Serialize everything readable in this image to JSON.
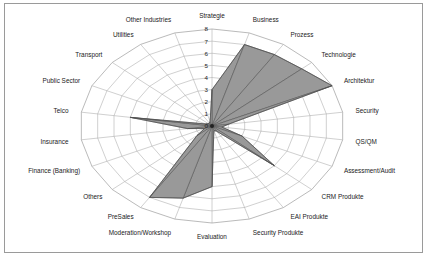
{
  "figure": {
    "border_color": "#9a9a9a",
    "background": "#ffffff"
  },
  "chart_data": {
    "type": "radar",
    "title": "",
    "subtitle": "",
    "xlabel": "",
    "ylabel": "",
    "grid": true,
    "legend_position": "none",
    "rlim": [
      0,
      8
    ],
    "tick_labels": [
      "0",
      "1",
      "2",
      "3",
      "4",
      "5",
      "6",
      "7",
      "8"
    ],
    "tick_values": [
      0,
      1,
      2,
      3,
      4,
      5,
      6,
      7,
      8
    ],
    "tick_axis": "Strategie",
    "fill_color": "#999999",
    "line_color": "#4d4d4d",
    "grid_color": "#a8a8a8",
    "categories": [
      "Strategie",
      "Business",
      "Prozess",
      "Technologie",
      "Architektur",
      "Security",
      "QS/QM",
      "Assessment/Audit",
      "CRM Produkte",
      "EAI Produkte",
      "Security Produkte",
      "Evaluation",
      "Moderation/Workshop",
      "PreSales",
      "Others",
      "Finance (Banking)",
      "Insurance",
      "Telco",
      "Public Sector",
      "Transport",
      "Utilities",
      "Other Industries"
    ],
    "series": [
      {
        "name": "Profil",
        "values": [
          3.0,
          7.0,
          7.0,
          7.2,
          8.0,
          1.0,
          0.6,
          2.0,
          5.0,
          0.5,
          0.4,
          5.0,
          6.2,
          7.0,
          1.2,
          0.5,
          1.5,
          5.0,
          0.4,
          0.3,
          0.3,
          0.4
        ]
      }
    ]
  }
}
